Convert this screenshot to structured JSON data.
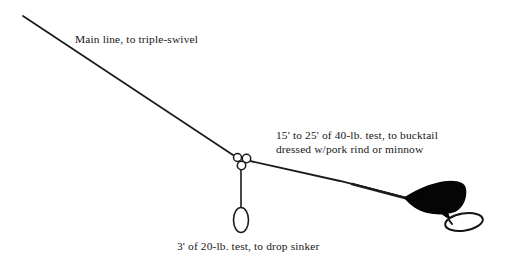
{
  "diagram": {
    "background_color": "#ffffff",
    "ink_color": "#161616",
    "labels": {
      "main_line": "Main line, to triple-swivel",
      "leader_line_1": "15' to 25' of 40-lb. test, to bucktail",
      "leader_line_2": "dressed w/pork rind or minnow",
      "dropper": "3' of 20-lb. test, to drop sinker"
    },
    "components": {
      "main_line": "main-line",
      "triple_swivel": "triple-swivel",
      "dropper_line": "dropper-line",
      "drop_sinker": "drop-sinker",
      "leader_line": "leader-line",
      "bucktail_lure": "bucktail-lure",
      "hook": "hook-loop"
    }
  }
}
